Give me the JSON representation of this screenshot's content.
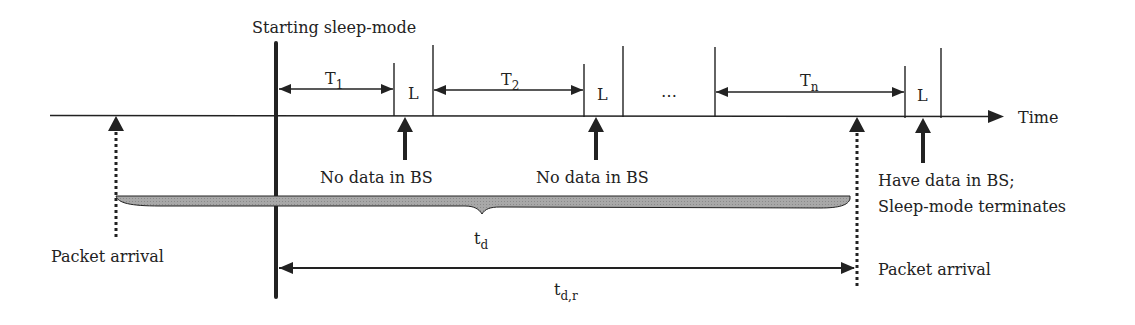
{
  "title": "Starting sleep-mode",
  "axis": {
    "label": "Time"
  },
  "intervals": [
    {
      "label": "T",
      "sub": "1"
    },
    {
      "label": "T",
      "sub": "2"
    },
    {
      "label": "T",
      "sub": "n"
    }
  ],
  "listen_label": "L",
  "ellipsis": "…",
  "events": {
    "no_data_1": "No data in BS",
    "no_data_2": "No data in BS",
    "have_data_line1": "Have data in BS;",
    "have_data_line2": "Sleep-mode terminates",
    "packet_arrival_left": "Packet arrival",
    "packet_arrival_right": "Packet arrival"
  },
  "delays": {
    "td": {
      "label": "t",
      "sub": "d"
    },
    "tdr": {
      "label": "t",
      "sub": "d,r"
    }
  },
  "colors": {
    "line": "#222222",
    "brace_fill": "#9a9a9a",
    "text": "#222222"
  }
}
